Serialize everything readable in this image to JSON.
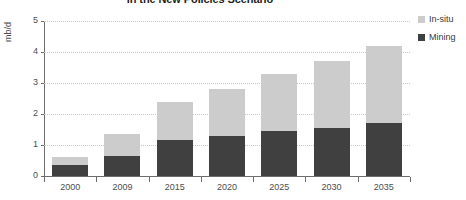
{
  "chart_data": {
    "type": "bar",
    "stacked": true,
    "title": "in the New Policies Scenario",
    "xlabel": "",
    "ylabel": "mb/d",
    "ylim": [
      0,
      5
    ],
    "yticks": [
      0,
      1,
      2,
      3,
      4,
      5
    ],
    "ytick_labels": [
      "0",
      "1",
      "2",
      "3",
      "4",
      "5"
    ],
    "grid": true,
    "legend_position": "right",
    "categories": [
      "2000",
      "2009",
      "2015",
      "2020",
      "2025",
      "2030",
      "2035"
    ],
    "series": [
      {
        "name": "Mining",
        "color": "#404040",
        "values": [
          0.35,
          0.65,
          1.15,
          1.3,
          1.45,
          1.55,
          1.7
        ]
      },
      {
        "name": "In-situ",
        "color": "#cccccc",
        "values": [
          0.25,
          0.7,
          1.25,
          1.5,
          1.85,
          2.15,
          2.5
        ]
      }
    ],
    "totals": [
      0.6,
      1.35,
      2.4,
      2.8,
      3.3,
      3.7,
      4.2
    ]
  },
  "legend": {
    "items": [
      {
        "label": "In-situ",
        "color": "#cccccc"
      },
      {
        "label": "Mining",
        "color": "#404040"
      }
    ]
  }
}
